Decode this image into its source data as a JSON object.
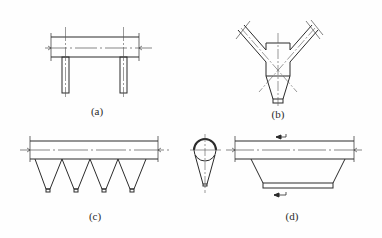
{
  "diagram": {
    "type": "technical-drawing",
    "line_color": "#2b2b2b",
    "axis_color": "#555555",
    "panels": [
      {
        "id": "a",
        "label": "(a)",
        "description": "horizontal duct with two vertical branch pipes below"
      },
      {
        "id": "b",
        "label": "(b)",
        "description": "Y-shaped twin inlet ducts merging into a box with conical hopper"
      },
      {
        "id": "c",
        "label": "(c)",
        "description": "horizontal duct with four pyramidal hoppers below"
      },
      {
        "id": "d",
        "label": "(d)",
        "description": "horizontal duct with trapezoidal hopper, flow arrows, and side section view with circle and cone"
      }
    ]
  }
}
